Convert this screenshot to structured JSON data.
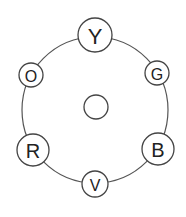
{
  "diagram": {
    "type": "color-wheel-nodes",
    "ring": {
      "cx": 95,
      "cy": 110,
      "r": 73,
      "stroke": "#555555"
    },
    "center_node": {
      "cx": 96,
      "cy": 107,
      "r": 12,
      "label": ""
    },
    "nodes": [
      {
        "id": "Y",
        "label": "Y",
        "cx": 95,
        "cy": 35,
        "r": 17,
        "font_size": 22
      },
      {
        "id": "G",
        "label": "G",
        "cx": 157,
        "cy": 73,
        "r": 12,
        "font_size": 16
      },
      {
        "id": "B",
        "label": "B",
        "cx": 158,
        "cy": 149,
        "r": 16,
        "font_size": 20
      },
      {
        "id": "V",
        "label": "V",
        "cx": 95,
        "cy": 184,
        "r": 13,
        "font_size": 16
      },
      {
        "id": "R",
        "label": "R",
        "cx": 33,
        "cy": 150,
        "r": 16,
        "font_size": 20
      },
      {
        "id": "O",
        "label": "O",
        "cx": 31,
        "cy": 75,
        "r": 12,
        "font_size": 16
      }
    ]
  }
}
